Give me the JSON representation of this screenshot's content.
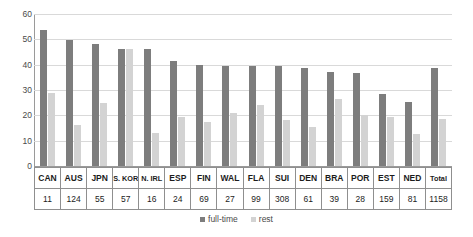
{
  "chart_data": {
    "type": "bar",
    "title": "",
    "subtitle": "",
    "xlabel": "",
    "ylabel": "",
    "ylim": [
      0,
      60
    ],
    "yticks": [
      0,
      10,
      20,
      30,
      40,
      50,
      60
    ],
    "grid": true,
    "legend_position": "bottom",
    "categories": [
      "CAN",
      "AUS",
      "JPN",
      "S. KOR",
      "N. IRL",
      "ESP",
      "FIN",
      "WAL",
      "FLA",
      "SUI",
      "DEN",
      "BRA",
      "POR",
      "EST",
      "NED",
      "Total"
    ],
    "counts": [
      11,
      124,
      55,
      57,
      16,
      24,
      69,
      27,
      99,
      308,
      61,
      39,
      28,
      159,
      81,
      1158
    ],
    "series": [
      {
        "name": "full-time",
        "color": "#7d7d7d",
        "values": [
          53.5,
          49.8,
          48.3,
          46.2,
          46.0,
          41.5,
          39.8,
          39.5,
          39.5,
          39.3,
          38.8,
          37.0,
          36.8,
          28.3,
          25.3,
          38.7
        ]
      },
      {
        "name": "rest",
        "color": "#d3d3d3",
        "values": [
          29.0,
          16.0,
          25.0,
          46.2,
          13.0,
          19.5,
          17.5,
          21.0,
          24.0,
          18.0,
          15.5,
          26.5,
          20.0,
          19.5,
          12.5,
          18.5
        ]
      }
    ]
  },
  "axis": {
    "y_tick_labels": [
      "60",
      "50",
      "40",
      "30",
      "20",
      "10",
      "0"
    ]
  },
  "legend": {
    "items": [
      {
        "label": "full-time",
        "color": "#7d7d7d"
      },
      {
        "label": "rest",
        "color": "#d3d3d3"
      }
    ]
  },
  "table": {
    "row_labels": [
      "CAN",
      "AUS",
      "JPN",
      "S. KOR",
      "N. IRL",
      "ESP",
      "FIN",
      "WAL",
      "FLA",
      "SUI",
      "DEN",
      "BRA",
      "POR",
      "EST",
      "NED",
      "Total"
    ],
    "row_values": [
      "11",
      "124",
      "55",
      "57",
      "16",
      "24",
      "69",
      "27",
      "99",
      "308",
      "61",
      "39",
      "28",
      "159",
      "81",
      "1158"
    ]
  }
}
